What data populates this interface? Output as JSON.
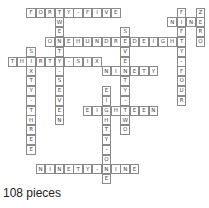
{
  "grid": {
    "origin_x": 7.6,
    "origin_y": 7.6,
    "cell_w": 9.4,
    "cell_h": 9.8,
    "entries": [
      {
        "word": "FORTY-FIVE",
        "row": 0,
        "col": 2,
        "dir": "across"
      },
      {
        "word": "ONEHUNDREDEIGHT",
        "row": 3,
        "col": 4,
        "dir": "across"
      },
      {
        "word": "THIRTY-SIX",
        "row": 5,
        "col": 0,
        "dir": "across"
      },
      {
        "word": "NINETY",
        "row": 6,
        "col": 10,
        "dir": "across"
      },
      {
        "word": "EIGHTEEN",
        "row": 10,
        "col": 8,
        "dir": "across"
      },
      {
        "word": "NINETY-NINE",
        "row": 16,
        "col": 3,
        "dir": "across"
      },
      {
        "word": "NINE",
        "row": 1,
        "col": 17,
        "dir": "across"
      },
      {
        "word": "TWENTY-SEVEN",
        "row": 0,
        "col": 5,
        "dir": "down"
      },
      {
        "word": "SIXTY-THREE",
        "row": 4,
        "col": 2,
        "dir": "down"
      },
      {
        "word": "SEVENTY-TWO",
        "row": 2,
        "col": 12,
        "dir": "down"
      },
      {
        "word": "EIGHTY-ONE",
        "row": 8,
        "col": 10,
        "dir": "down"
      },
      {
        "word": "FIFTY-FOUR",
        "row": 0,
        "col": 18,
        "dir": "down"
      },
      {
        "word": "ZERO",
        "row": 0,
        "col": 20,
        "dir": "down"
      }
    ]
  },
  "footer": {
    "pieces_label": "108 pieces"
  }
}
